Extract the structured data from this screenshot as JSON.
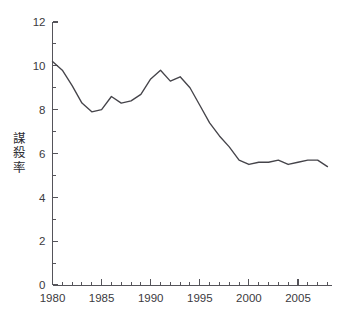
{
  "chart_data": {
    "type": "line",
    "title": "",
    "xlabel": "",
    "ylabel": "謀殺率",
    "xlim": [
      1980,
      2008
    ],
    "ylim": [
      0,
      12
    ],
    "grid": false,
    "legend": null,
    "y_major_ticks": [
      0,
      2,
      4,
      6,
      8,
      10,
      12
    ],
    "y_minor_ticks": [
      1,
      3,
      5,
      7,
      9,
      11
    ],
    "x_major_ticks": [
      1980,
      1985,
      1990,
      1995,
      2000,
      2005
    ],
    "x_tick_labels": [
      "1980",
      "1985",
      "1990",
      "1995",
      "2000",
      "2005"
    ],
    "y_tick_labels": [
      "0",
      "2",
      "4",
      "6",
      "8",
      "10",
      "12"
    ],
    "x_minor_tick_step": 1,
    "line_color": "#45444a",
    "axis_color": "#55545a",
    "text_color": "#3b3a40",
    "background_color": "#ffffff",
    "series": [
      {
        "name": "謀殺率",
        "x": [
          1980,
          1981,
          1982,
          1983,
          1984,
          1985,
          1986,
          1987,
          1988,
          1989,
          1990,
          1991,
          1992,
          1993,
          1994,
          1995,
          1996,
          1997,
          1998,
          1999,
          2000,
          2001,
          2002,
          2003,
          2004,
          2005,
          2006,
          2007,
          2008
        ],
        "values": [
          10.2,
          9.8,
          9.1,
          8.3,
          7.9,
          8.0,
          8.6,
          8.3,
          8.4,
          8.7,
          9.4,
          9.8,
          9.3,
          9.5,
          9.0,
          8.2,
          7.4,
          6.8,
          6.3,
          5.7,
          5.5,
          5.6,
          5.6,
          5.7,
          5.5,
          5.6,
          5.7,
          5.7,
          5.4
        ]
      }
    ]
  }
}
